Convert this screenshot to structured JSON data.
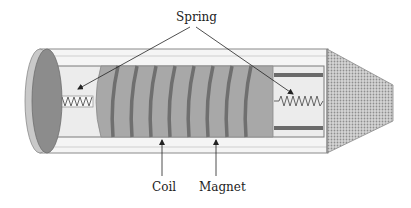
{
  "diagram": {
    "labels": {
      "spring": "Spring",
      "coil": "Coil",
      "magnet": "Magnet"
    },
    "colors": {
      "background": "#ffffff",
      "tube_fill": "#f4f4f4",
      "tube_stroke": "#8a8a8a",
      "end_cap_outer": "#c8c8c8",
      "end_cap_inner": "#8c8c8c",
      "chamber_fill": "#e9e9e9",
      "magnet_fill": "#a6a6a6",
      "coil_stripe": "#6f6f6f",
      "bar_fill": "#6a6a6a",
      "mesh_fill": "#d0d0d0",
      "mesh_dot": "#8e8e8e",
      "arrow": "#222222"
    },
    "coil_turns": 8
  }
}
